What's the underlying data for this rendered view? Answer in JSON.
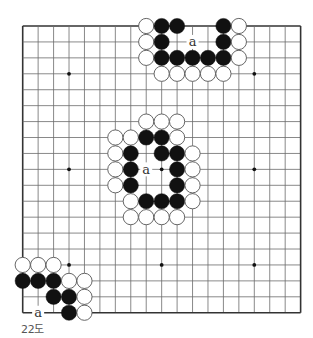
{
  "diagram": {
    "type": "go-board",
    "size": 19,
    "caption": "22도",
    "geometry": {
      "x0": 22.7,
      "y0": 26,
      "dx": 15.44,
      "dy": 15.93,
      "stone_r": 7.6
    },
    "colors": {
      "line": "#6b6b6b",
      "border": "#333333",
      "black": "#111111",
      "white_fill": "#ffffff",
      "white_stroke": "#555555",
      "label": "#333333",
      "caption": "#555555"
    },
    "hoshi": [
      [
        3,
        3
      ],
      [
        3,
        9
      ],
      [
        3,
        15
      ],
      [
        9,
        3
      ],
      [
        9,
        9
      ],
      [
        9,
        15
      ],
      [
        15,
        3
      ],
      [
        15,
        9
      ],
      [
        15,
        15
      ]
    ],
    "stones": [
      {
        "row": 0,
        "col": 8,
        "color": "white"
      },
      {
        "row": 0,
        "col": 9,
        "color": "black"
      },
      {
        "row": 0,
        "col": 10,
        "color": "black"
      },
      {
        "row": 0,
        "col": 13,
        "color": "black"
      },
      {
        "row": 0,
        "col": 14,
        "color": "white"
      },
      {
        "row": 1,
        "col": 8,
        "color": "white"
      },
      {
        "row": 1,
        "col": 9,
        "color": "black"
      },
      {
        "row": 1,
        "col": 13,
        "color": "black"
      },
      {
        "row": 1,
        "col": 14,
        "color": "white"
      },
      {
        "row": 2,
        "col": 8,
        "color": "white"
      },
      {
        "row": 2,
        "col": 9,
        "color": "black"
      },
      {
        "row": 2,
        "col": 10,
        "color": "black"
      },
      {
        "row": 2,
        "col": 11,
        "color": "black"
      },
      {
        "row": 2,
        "col": 12,
        "color": "black"
      },
      {
        "row": 2,
        "col": 13,
        "color": "black"
      },
      {
        "row": 2,
        "col": 14,
        "color": "white"
      },
      {
        "row": 3,
        "col": 9,
        "color": "white"
      },
      {
        "row": 3,
        "col": 10,
        "color": "white"
      },
      {
        "row": 3,
        "col": 11,
        "color": "white"
      },
      {
        "row": 3,
        "col": 12,
        "color": "white"
      },
      {
        "row": 3,
        "col": 13,
        "color": "white"
      },
      {
        "row": 6,
        "col": 8,
        "color": "white"
      },
      {
        "row": 6,
        "col": 9,
        "color": "white"
      },
      {
        "row": 6,
        "col": 10,
        "color": "white"
      },
      {
        "row": 7,
        "col": 6,
        "color": "white"
      },
      {
        "row": 7,
        "col": 7,
        "color": "white"
      },
      {
        "row": 7,
        "col": 8,
        "color": "black"
      },
      {
        "row": 7,
        "col": 9,
        "color": "black"
      },
      {
        "row": 7,
        "col": 10,
        "color": "white"
      },
      {
        "row": 8,
        "col": 6,
        "color": "white"
      },
      {
        "row": 8,
        "col": 7,
        "color": "black"
      },
      {
        "row": 8,
        "col": 9,
        "color": "black"
      },
      {
        "row": 8,
        "col": 10,
        "color": "black"
      },
      {
        "row": 8,
        "col": 11,
        "color": "white"
      },
      {
        "row": 9,
        "col": 6,
        "color": "white"
      },
      {
        "row": 9,
        "col": 7,
        "color": "black"
      },
      {
        "row": 9,
        "col": 10,
        "color": "black"
      },
      {
        "row": 9,
        "col": 11,
        "color": "white"
      },
      {
        "row": 10,
        "col": 6,
        "color": "white"
      },
      {
        "row": 10,
        "col": 7,
        "color": "black"
      },
      {
        "row": 10,
        "col": 10,
        "color": "black"
      },
      {
        "row": 10,
        "col": 11,
        "color": "white"
      },
      {
        "row": 11,
        "col": 7,
        "color": "white"
      },
      {
        "row": 11,
        "col": 8,
        "color": "black"
      },
      {
        "row": 11,
        "col": 9,
        "color": "black"
      },
      {
        "row": 11,
        "col": 10,
        "color": "black"
      },
      {
        "row": 11,
        "col": 11,
        "color": "white"
      },
      {
        "row": 12,
        "col": 7,
        "color": "white"
      },
      {
        "row": 12,
        "col": 8,
        "color": "white"
      },
      {
        "row": 12,
        "col": 9,
        "color": "white"
      },
      {
        "row": 12,
        "col": 10,
        "color": "white"
      },
      {
        "row": 15,
        "col": 0,
        "color": "white"
      },
      {
        "row": 15,
        "col": 1,
        "color": "white"
      },
      {
        "row": 15,
        "col": 2,
        "color": "white"
      },
      {
        "row": 16,
        "col": 0,
        "color": "black"
      },
      {
        "row": 16,
        "col": 1,
        "color": "black"
      },
      {
        "row": 16,
        "col": 2,
        "color": "black"
      },
      {
        "row": 16,
        "col": 3,
        "color": "white"
      },
      {
        "row": 16,
        "col": 4,
        "color": "white"
      },
      {
        "row": 17,
        "col": 2,
        "color": "black"
      },
      {
        "row": 17,
        "col": 3,
        "color": "black"
      },
      {
        "row": 17,
        "col": 4,
        "color": "white"
      },
      {
        "row": 18,
        "col": 3,
        "color": "black"
      },
      {
        "row": 18,
        "col": 4,
        "color": "white"
      }
    ],
    "labels": [
      {
        "row": 1,
        "col": 11,
        "text": "a"
      },
      {
        "row": 9,
        "col": 8,
        "text": "a"
      },
      {
        "row": 18,
        "col": 1,
        "text": "a"
      }
    ],
    "visible_board": {
      "rows": [
        0,
        18
      ],
      "cols": [
        0,
        18
      ]
    }
  }
}
